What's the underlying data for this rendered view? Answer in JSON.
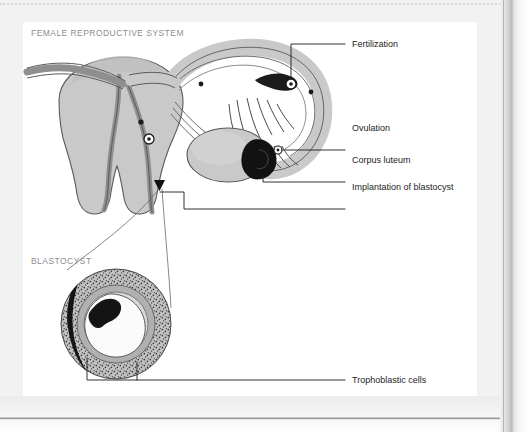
{
  "figure": {
    "sections": [
      {
        "id": "female-reproductive-system",
        "caption": "FEMALE REPRODUCTIVE SYSTEM"
      },
      {
        "id": "blastocyst",
        "caption": "BLASTOCYST"
      }
    ],
    "callouts": [
      {
        "id": "fertilization",
        "label": "Fertilization"
      },
      {
        "id": "ovulation",
        "label": "Ovulation"
      },
      {
        "id": "corpus-luteum",
        "label": "Corpus luteum"
      },
      {
        "id": "implantation",
        "label": "Implantation of blastocyst"
      },
      {
        "id": "trophoblastic",
        "label": "Trophoblastic cells"
      }
    ],
    "colors": {
      "page_background": "#f2f2f2",
      "card_background": "#ffffff",
      "caption_text": "#8e8e8e",
      "label_text": "#1c1c1c",
      "leader_line": "#1c1c1c",
      "organ_fill": "#c9c9c9",
      "organ_fill_light": "#dcdcdc",
      "organ_outline": "#5a5a5a",
      "cavity_fill": "#9a9a9a",
      "corpus_luteum_fill": "#121212",
      "blastocyst_stipple": "#a8a8a8"
    }
  }
}
